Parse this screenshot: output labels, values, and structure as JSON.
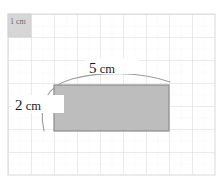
{
  "figure": {
    "unit_square": {
      "label": "1 cm",
      "name": "unit-reference-square",
      "x": 8,
      "y": 14,
      "size_px": 23,
      "fill": "#d3d3d3"
    },
    "grid": {
      "origin_x": 8,
      "origin_y": 14,
      "cell_px": 23,
      "cols": 9,
      "rows": 7,
      "major_color": "#dcdcdc",
      "minor_color": "#e8e8e8",
      "minor_dashed": true
    },
    "rectangle": {
      "name": "shaded-rectangle",
      "x": 54,
      "y": 85,
      "width_px": 115,
      "height_px": 46,
      "fill": "#bdbdbd",
      "stroke": "#8f8f8f",
      "width_cm": 5,
      "height_cm": 2,
      "area_cm2": 10
    },
    "dimension_arc": {
      "name": "dimension-arc",
      "stroke": "#9a9a9a",
      "style": "elliptical-arc-wrapping-top-left"
    },
    "labels": {
      "width": "5 cm",
      "width_value": "5",
      "width_unit": "cm",
      "height": "2 cm",
      "height_value": "2",
      "height_unit": "cm",
      "unit_square": "1 cm"
    }
  }
}
